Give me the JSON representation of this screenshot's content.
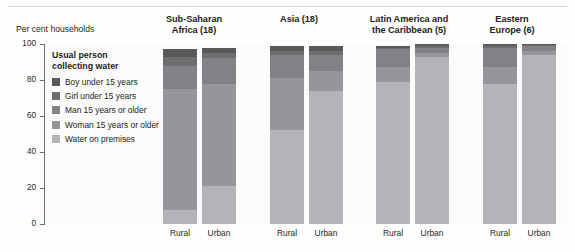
{
  "figure": {
    "y_axis_title": "Per cent households",
    "legend_title_line1": "Usual person",
    "legend_title_line2": "collecting water"
  },
  "legend": {
    "items": [
      {
        "label": "Boy under 15 years",
        "color": "#58595b"
      },
      {
        "label": "Girl under 15 years",
        "color": "#6d6e70"
      },
      {
        "label": "Man 15 years or older",
        "color": "#808285"
      },
      {
        "label": "Woman 15 years or older",
        "color": "#949699"
      },
      {
        "label": "Water on premises",
        "color": "#b2b4b7"
      }
    ]
  },
  "chart_data": {
    "type": "bar",
    "title": "",
    "xlabel": "",
    "ylabel": "Per cent households",
    "ylim": [
      0,
      100
    ],
    "yticks": [
      0,
      20,
      40,
      60,
      80,
      100
    ],
    "ytick_labels": [
      "0",
      "20",
      "40",
      "60",
      "80",
      "100"
    ],
    "grid": false,
    "stacked": true,
    "legend_position": "inside-top-left",
    "groups": [
      {
        "name": "Sub-Saharan Africa (18)",
        "title_line1": "Sub-Saharan",
        "title_line2": "Africa (18)",
        "bars": [
          {
            "category": "Rural",
            "values": {
              "Water on premises": 8,
              "Woman 15 years or older": 67,
              "Man 15 years or older": 13,
              "Girl under 15 years": 5,
              "Boy under 15 years": 4
            }
          },
          {
            "category": "Urban",
            "values": {
              "Water on premises": 21,
              "Woman 15 years or older": 57,
              "Man 15 years or older": 14,
              "Girl under 15 years": 3,
              "Boy under 15 years": 3
            }
          }
        ]
      },
      {
        "name": "Asia (18)",
        "title_line1": "Asia (18)",
        "title_line2": "",
        "bars": [
          {
            "category": "Rural",
            "values": {
              "Water on premises": 52,
              "Woman 15 years or older": 29,
              "Man 15 years or older": 13,
              "Girl under 15 years": 2,
              "Boy under 15 years": 3
            }
          },
          {
            "category": "Urban",
            "values": {
              "Water on premises": 74,
              "Woman 15 years or older": 11,
              "Man 15 years or older": 9,
              "Girl under 15 years": 2,
              "Boy under 15 years": 3
            }
          }
        ]
      },
      {
        "name": "Latin America and the Caribbean (5)",
        "title_line1": "Latin America and",
        "title_line2": "the Caribbean (5)",
        "bars": [
          {
            "category": "Rural",
            "values": {
              "Water on premises": 79,
              "Woman 15 years or older": 8,
              "Man 15 years or older": 10,
              "Girl under 15 years": 1,
              "Boy under 15 years": 1
            }
          },
          {
            "category": "Urban",
            "values": {
              "Water on premises": 93,
              "Woman 15 years or older": 2,
              "Man 15 years or older": 3,
              "Girl under 15 years": 1,
              "Boy under 15 years": 1
            }
          }
        ]
      },
      {
        "name": "Eastern Europe (6)",
        "title_line1": "Eastern",
        "title_line2": "Europe (6)",
        "bars": [
          {
            "category": "Rural",
            "values": {
              "Water on premises": 78,
              "Woman 15 years or older": 9,
              "Man 15 years or older": 11,
              "Girl under 15 years": 1,
              "Boy under 15 years": 1
            }
          },
          {
            "category": "Urban",
            "values": {
              "Water on premises": 94,
              "Woman 15 years or older": 2,
              "Man 15 years or older": 3,
              "Girl under 15 years": 0.5,
              "Boy under 15 years": 0.5
            }
          }
        ]
      }
    ]
  }
}
